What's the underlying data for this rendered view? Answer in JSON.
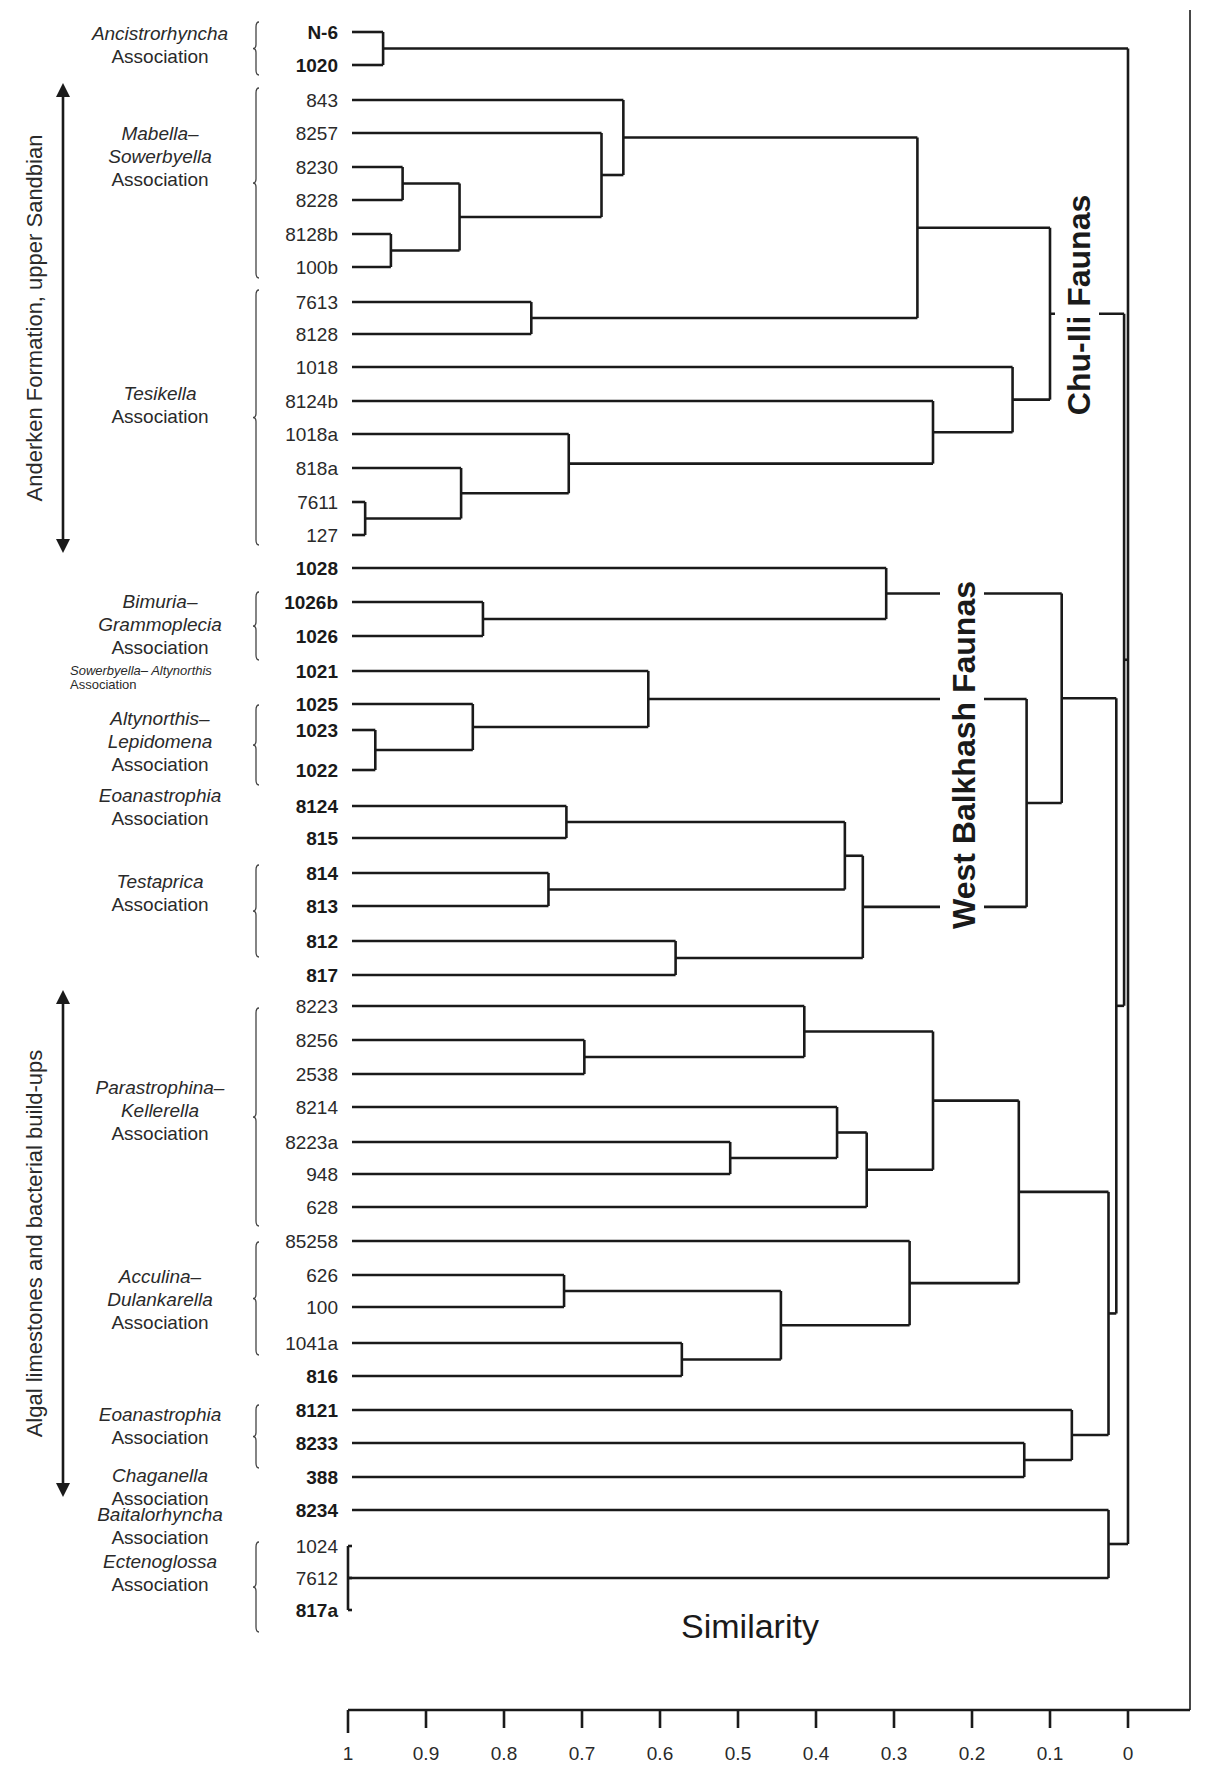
{
  "chart_data": {
    "type": "dendrogram",
    "title": "",
    "xlabel": "Similarity",
    "ylabel": "",
    "xlim": [
      1,
      0
    ],
    "x_ticks": [
      "1",
      "0.9",
      "0.8",
      "0.7",
      "0.6",
      "0.5",
      "0.4",
      "0.3",
      "0.2",
      "0.1",
      "0"
    ],
    "grid": false,
    "leaves": [
      {
        "id": "N-6",
        "bold": true,
        "y": 32
      },
      {
        "id": "1020",
        "bold": true,
        "y": 65
      },
      {
        "id": "843",
        "bold": false,
        "y": 100
      },
      {
        "id": "8257",
        "bold": false,
        "y": 133
      },
      {
        "id": "8230",
        "bold": false,
        "y": 167
      },
      {
        "id": "8228",
        "bold": false,
        "y": 200
      },
      {
        "id": "8128b",
        "bold": false,
        "y": 234
      },
      {
        "id": "100b",
        "bold": false,
        "y": 267
      },
      {
        "id": "7613",
        "bold": false,
        "y": 302
      },
      {
        "id": "8128",
        "bold": false,
        "y": 334
      },
      {
        "id": "1018",
        "bold": false,
        "y": 367
      },
      {
        "id": "8124b",
        "bold": false,
        "y": 401
      },
      {
        "id": "1018a",
        "bold": false,
        "y": 434
      },
      {
        "id": "818a",
        "bold": false,
        "y": 468
      },
      {
        "id": "7611",
        "bold": false,
        "y": 502
      },
      {
        "id": "127",
        "bold": false,
        "y": 535
      },
      {
        "id": "1028",
        "bold": true,
        "y": 568
      },
      {
        "id": "1026b",
        "bold": true,
        "y": 602
      },
      {
        "id": "1026",
        "bold": true,
        "y": 636
      },
      {
        "id": "1021",
        "bold": true,
        "y": 671
      },
      {
        "id": "1025",
        "bold": true,
        "y": 704
      },
      {
        "id": "1023",
        "bold": true,
        "y": 730
      },
      {
        "id": "1022",
        "bold": true,
        "y": 770
      },
      {
        "id": "8124",
        "bold": true,
        "y": 806
      },
      {
        "id": "815",
        "bold": true,
        "y": 838
      },
      {
        "id": "814",
        "bold": true,
        "y": 873
      },
      {
        "id": "813",
        "bold": true,
        "y": 906
      },
      {
        "id": "812",
        "bold": true,
        "y": 941
      },
      {
        "id": "817",
        "bold": true,
        "y": 975
      },
      {
        "id": "8223",
        "bold": false,
        "y": 1006
      },
      {
        "id": "8256",
        "bold": false,
        "y": 1040
      },
      {
        "id": "2538",
        "bold": false,
        "y": 1074
      },
      {
        "id": "8214",
        "bold": false,
        "y": 1107
      },
      {
        "id": "8223a",
        "bold": false,
        "y": 1142
      },
      {
        "id": "948",
        "bold": false,
        "y": 1174
      },
      {
        "id": "628",
        "bold": false,
        "y": 1207
      },
      {
        "id": "85258",
        "bold": false,
        "y": 1241
      },
      {
        "id": "626",
        "bold": false,
        "y": 1275
      },
      {
        "id": "100",
        "bold": false,
        "y": 1307
      },
      {
        "id": "1041a",
        "bold": false,
        "y": 1343
      },
      {
        "id": "816",
        "bold": true,
        "y": 1376
      },
      {
        "id": "8121",
        "bold": true,
        "y": 1410
      },
      {
        "id": "8233",
        "bold": true,
        "y": 1443
      },
      {
        "id": "388",
        "bold": true,
        "y": 1477
      },
      {
        "id": "8234",
        "bold": true,
        "y": 1510
      },
      {
        "id": "1024",
        "bold": false,
        "y": 1546
      },
      {
        "id": "7612",
        "bold": false,
        "y": 1578
      },
      {
        "id": "817a",
        "bold": true,
        "y": 1610
      }
    ],
    "merges": [
      {
        "id": "A1",
        "children": [
          "N-6",
          "1020"
        ],
        "similarity": 0.955
      },
      {
        "id": "M1",
        "children": [
          "8230",
          "8228"
        ],
        "similarity": 0.93
      },
      {
        "id": "M2",
        "children": [
          "8128b",
          "100b"
        ],
        "similarity": 0.945
      },
      {
        "id": "M3",
        "children": [
          "M1",
          "M2"
        ],
        "similarity": 0.857
      },
      {
        "id": "M4",
        "children": [
          "8257",
          "M3"
        ],
        "similarity": 0.675
      },
      {
        "id": "M5",
        "children": [
          "843",
          "M4"
        ],
        "similarity": 0.647
      },
      {
        "id": "T1",
        "children": [
          "7613",
          "8128"
        ],
        "similarity": 0.765
      },
      {
        "id": "M6",
        "children": [
          "M5",
          "T1"
        ],
        "similarity": 0.27
      },
      {
        "id": "T2",
        "children": [
          "7611",
          "127"
        ],
        "similarity": 0.978
      },
      {
        "id": "T3",
        "children": [
          "818a",
          "T2"
        ],
        "similarity": 0.855
      },
      {
        "id": "T4",
        "children": [
          "1018a",
          "T3"
        ],
        "similarity": 0.717
      },
      {
        "id": "T5",
        "children": [
          "8124b",
          "T4"
        ],
        "similarity": 0.25
      },
      {
        "id": "T6",
        "children": [
          "1018",
          "T5"
        ],
        "similarity": 0.148
      },
      {
        "id": "CI",
        "children": [
          "M6",
          "T6"
        ],
        "similarity": 0.1
      },
      {
        "id": "B1",
        "children": [
          "1026b",
          "1026"
        ],
        "similarity": 0.827
      },
      {
        "id": "B2",
        "children": [
          "1028",
          "B1"
        ],
        "similarity": 0.31
      },
      {
        "id": "L1",
        "children": [
          "1023",
          "1022"
        ],
        "similarity": 0.965
      },
      {
        "id": "L2",
        "children": [
          "1025",
          "L1"
        ],
        "similarity": 0.84
      },
      {
        "id": "L3",
        "children": [
          "1021",
          "L2"
        ],
        "similarity": 0.615
      },
      {
        "id": "E1",
        "children": [
          "8124",
          "815"
        ],
        "similarity": 0.72
      },
      {
        "id": "E2",
        "children": [
          "814",
          "813"
        ],
        "similarity": 0.743
      },
      {
        "id": "E3",
        "children": [
          "E1",
          "E2"
        ],
        "similarity": 0.363
      },
      {
        "id": "E4",
        "children": [
          "812",
          "817"
        ],
        "similarity": 0.58
      },
      {
        "id": "E5",
        "children": [
          "E3",
          "E4"
        ],
        "similarity": 0.34
      },
      {
        "id": "W1",
        "children": [
          "L3",
          "E5"
        ],
        "similarity": 0.13
      },
      {
        "id": "WB",
        "children": [
          "B2",
          "W1"
        ],
        "similarity": 0.085
      },
      {
        "id": "P1",
        "children": [
          "8256",
          "2538"
        ],
        "similarity": 0.697
      },
      {
        "id": "P2",
        "children": [
          "8223",
          "P1"
        ],
        "similarity": 0.415
      },
      {
        "id": "P3",
        "children": [
          "8223a",
          "948"
        ],
        "similarity": 0.51
      },
      {
        "id": "P4",
        "children": [
          "8214",
          "P3"
        ],
        "similarity": 0.373
      },
      {
        "id": "P5",
        "children": [
          "P4",
          "628"
        ],
        "similarity": 0.335
      },
      {
        "id": "P6",
        "children": [
          "P2",
          "P5"
        ],
        "similarity": 0.25
      },
      {
        "id": "D1",
        "children": [
          "626",
          "100"
        ],
        "similarity": 0.723
      },
      {
        "id": "D2",
        "children": [
          "1041a",
          "816"
        ],
        "similarity": 0.572
      },
      {
        "id": "D3",
        "children": [
          "D1",
          "D2"
        ],
        "similarity": 0.445
      },
      {
        "id": "D4",
        "children": [
          "85258",
          "D3"
        ],
        "similarity": 0.28
      },
      {
        "id": "PD",
        "children": [
          "P6",
          "D4"
        ],
        "similarity": 0.14
      },
      {
        "id": "C1",
        "children": [
          "8233",
          "388"
        ],
        "similarity": 0.133
      },
      {
        "id": "C2",
        "children": [
          "8121",
          "C1"
        ],
        "similarity": 0.072
      },
      {
        "id": "G1",
        "children": [
          "PD",
          "C2"
        ],
        "similarity": 0.025
      },
      {
        "id": "X1",
        "children": [
          "1024",
          "7612",
          "817a"
        ],
        "similarity": 1.0
      },
      {
        "id": "X2",
        "children": [
          "8234",
          "X1"
        ],
        "similarity": 0.025
      },
      {
        "id": "WBG",
        "children": [
          "WB",
          "G1"
        ],
        "similarity": 0.015
      },
      {
        "id": "R1",
        "children": [
          "CI",
          "WBG"
        ],
        "similarity": 0.005
      },
      {
        "id": "ROOT",
        "children": [
          "A1",
          "R1",
          "X2"
        ],
        "similarity": 0.0
      }
    ],
    "annotations": [
      "Chu-Ili Faunas",
      "West Balkhash Faunas"
    ]
  },
  "associations": [
    {
      "name": "Ancistrorhyncha",
      "suffix": "Association",
      "brace": [
        22,
        75
      ],
      "label_y": 40
    },
    {
      "name": "Mabella–",
      "name2": "Sowerbyella",
      "suffix": "Association",
      "brace": [
        88,
        278
      ],
      "label_y": 140
    },
    {
      "name": "Tesikella",
      "suffix": "Association",
      "brace": [
        290,
        545
      ],
      "label_y": 400
    },
    {
      "name": "Bimuria–",
      "name2": "Grammoplecia",
      "suffix": "Association",
      "brace": [
        592,
        660
      ],
      "label_y": 608
    },
    {
      "name": "Sowerbyella– Altynorthis",
      "suffix": "Association",
      "brace": null,
      "label_y": 675,
      "small": true
    },
    {
      "name": "Altynorthis–",
      "name2": "Lepidomena",
      "suffix": "Association",
      "brace": [
        705,
        785
      ],
      "label_y": 725
    },
    {
      "name": "Eoanastrophia",
      "suffix": "Association",
      "brace": null,
      "label_y": 802
    },
    {
      "name": "Testaprica",
      "suffix": "Association",
      "brace": [
        865,
        957
      ],
      "label_y": 888
    },
    {
      "name": "Parastrophina–",
      "name2": "Kellerella",
      "suffix": "Association",
      "brace": [
        1008,
        1226
      ],
      "label_y": 1094
    },
    {
      "name": "Acculina–",
      "name2": "Dulankarella",
      "suffix": "Association",
      "brace": [
        1242,
        1355
      ],
      "label_y": 1283
    },
    {
      "name": "Eoanastrophia",
      "suffix": "Association",
      "brace": [
        1405,
        1468
      ],
      "label_y": 1421
    },
    {
      "name": "Chaganella",
      "suffix": "Association",
      "brace": null,
      "label_y": 1482
    },
    {
      "name": "Baitalorhyncha",
      "suffix": "Association",
      "brace": null,
      "label_y": 1521
    },
    {
      "name": "Ectenoglossa",
      "suffix": "Association",
      "brace": [
        1542,
        1632
      ],
      "label_y": 1568
    }
  ],
  "side_labels": [
    {
      "text": "Anderken Formation, upper Sandbian",
      "y_top": 83,
      "y_bottom": 553
    },
    {
      "text": "Algal limestones and bacterial build-ups",
      "y_top": 990,
      "y_bottom": 1497
    }
  ],
  "fauna_labels": {
    "chu_ili": "Chu-Ili Faunas",
    "west_balkhash": "West Balkhash Faunas"
  },
  "axis": {
    "title": "Similarity"
  }
}
